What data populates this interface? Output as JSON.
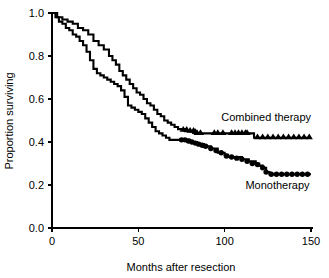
{
  "chart_data": {
    "type": "line",
    "subtype": "kaplan-meier-survival",
    "title": "",
    "xlabel": "Months after resection",
    "ylabel": "Proportion surviving",
    "xlim": [
      0,
      150
    ],
    "ylim": [
      0.0,
      1.0
    ],
    "xticks": [
      0,
      50,
      100,
      150
    ],
    "xtick_labels": [
      "0",
      "50",
      "100",
      "150"
    ],
    "yticks": [
      0.0,
      0.2,
      0.4,
      0.6,
      0.8,
      1.0
    ],
    "ytick_labels": [
      "0.0",
      "0.2",
      "0.4",
      "0.6",
      "0.8",
      "1.0"
    ],
    "grid": false,
    "legend_position": "inline-annotation",
    "line_color": "#000000",
    "background_color": "#ffffff",
    "series": [
      {
        "name": "Combined therapy",
        "label": "Combined therapy",
        "censor_marker": "triangle",
        "final_value": 0.42,
        "annotation_x": 98,
        "annotation_y": 0.5,
        "x": [
          0,
          3,
          6,
          9,
          12,
          15,
          18,
          21,
          24,
          27,
          30,
          33,
          35,
          37,
          39,
          41,
          43,
          45,
          47,
          49,
          51,
          53,
          55,
          57,
          59,
          61,
          63,
          65,
          67,
          69,
          71,
          73,
          75,
          77,
          79,
          81,
          83,
          85,
          90,
          100,
          110,
          115,
          117,
          125,
          135,
          150
        ],
        "y": [
          1.0,
          0.98,
          0.97,
          0.96,
          0.95,
          0.93,
          0.92,
          0.9,
          0.87,
          0.85,
          0.83,
          0.8,
          0.78,
          0.76,
          0.73,
          0.71,
          0.69,
          0.67,
          0.65,
          0.63,
          0.62,
          0.6,
          0.58,
          0.57,
          0.55,
          0.53,
          0.52,
          0.5,
          0.49,
          0.48,
          0.47,
          0.46,
          0.46,
          0.45,
          0.45,
          0.45,
          0.44,
          0.44,
          0.44,
          0.44,
          0.44,
          0.44,
          0.42,
          0.42,
          0.42,
          0.42
        ],
        "censor_x": [
          76,
          78,
          80,
          82,
          83,
          84,
          86,
          94,
          96,
          99,
          104,
          106,
          108,
          110,
          112,
          113,
          119,
          122,
          125,
          128,
          131,
          134,
          137,
          140,
          143,
          146,
          149
        ],
        "censor_y": [
          0.455,
          0.455,
          0.45,
          0.45,
          0.445,
          0.44,
          0.44,
          0.44,
          0.44,
          0.44,
          0.44,
          0.44,
          0.44,
          0.44,
          0.44,
          0.44,
          0.42,
          0.42,
          0.42,
          0.42,
          0.42,
          0.42,
          0.42,
          0.42,
          0.42,
          0.42,
          0.42
        ]
      },
      {
        "name": "Monotherapy",
        "label": "Monotherapy",
        "censor_marker": "circle",
        "final_value": 0.25,
        "annotation_x": 112,
        "annotation_y": 0.18,
        "x": [
          0,
          2,
          4,
          6,
          8,
          10,
          12,
          14,
          16,
          18,
          20,
          22,
          24,
          26,
          28,
          30,
          32,
          34,
          36,
          38,
          40,
          42,
          44,
          46,
          48,
          50,
          52,
          54,
          56,
          58,
          60,
          62,
          64,
          66,
          68,
          70,
          72,
          74,
          76,
          80,
          84,
          88,
          92,
          96,
          100,
          102,
          106,
          110,
          114,
          118,
          120,
          122,
          124,
          126,
          132,
          140,
          150
        ],
        "y": [
          1.0,
          0.98,
          0.96,
          0.95,
          0.93,
          0.92,
          0.9,
          0.89,
          0.87,
          0.85,
          0.82,
          0.78,
          0.74,
          0.72,
          0.71,
          0.7,
          0.69,
          0.68,
          0.67,
          0.66,
          0.64,
          0.61,
          0.57,
          0.56,
          0.55,
          0.54,
          0.53,
          0.51,
          0.49,
          0.47,
          0.45,
          0.44,
          0.43,
          0.42,
          0.41,
          0.41,
          0.41,
          0.41,
          0.41,
          0.4,
          0.39,
          0.38,
          0.37,
          0.35,
          0.34,
          0.33,
          0.33,
          0.32,
          0.31,
          0.3,
          0.29,
          0.28,
          0.26,
          0.25,
          0.25,
          0.25,
          0.25
        ],
        "censor_x": [
          75,
          77,
          79,
          81,
          83,
          85,
          87,
          89,
          92,
          95,
          98,
          101,
          104,
          107,
          110,
          113,
          116,
          119,
          122,
          124,
          127,
          130,
          133,
          136,
          139,
          142,
          145,
          148
        ],
        "censor_y": [
          0.41,
          0.41,
          0.405,
          0.4,
          0.395,
          0.39,
          0.385,
          0.38,
          0.37,
          0.36,
          0.35,
          0.335,
          0.33,
          0.325,
          0.32,
          0.31,
          0.3,
          0.295,
          0.28,
          0.26,
          0.25,
          0.25,
          0.25,
          0.25,
          0.25,
          0.25,
          0.25,
          0.25
        ]
      }
    ]
  }
}
